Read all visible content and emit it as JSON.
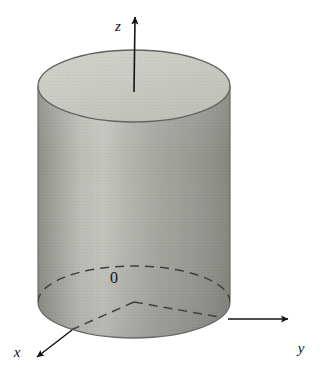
{
  "figure": {
    "kind": "3d-solid-diagram",
    "background_color": "#ffffff",
    "width": 327,
    "height": 384
  },
  "axes": {
    "z": {
      "label": "z",
      "label_x": 118,
      "label_y": 31,
      "arrow_tip_x": 136,
      "arrow_tip_y": 13,
      "origin_x": 134,
      "origin_y": 302,
      "solid_segment": "from top of cylinder up to arrow tip",
      "dashed_segment": "through the interior of the cylinder"
    },
    "y": {
      "label": "y",
      "label_x": 299,
      "label_y": 352,
      "arrow_tip_x": 292,
      "arrow_tip_y": 320,
      "solid_segment": "outside the cylinder silhouette",
      "dashed_segment": "inside the cylinder from origin"
    },
    "x": {
      "label": "x",
      "label_x": 16,
      "label_y": 357,
      "arrow_tip_x": 33,
      "arrow_tip_y": 360,
      "solid_segment": "outside the cylinder silhouette",
      "dashed_segment": "inside the cylinder from origin"
    }
  },
  "origin": {
    "label": "0",
    "label_x": 110,
    "label_y": 282,
    "point_x": 134,
    "point_y": 302
  },
  "cylinder": {
    "center_x": 134,
    "radius_x": 96,
    "radius_y": 36,
    "top_center_y": 86,
    "bottom_center_y": 302,
    "top_face_color": "#c9c9c4",
    "body_light_color": "#c2c2bd",
    "body_mid_color": "#a8a8a3",
    "body_dark_color": "#8e8e89",
    "outline_color": "#5a5a57"
  },
  "colors": {
    "ink": "#141414",
    "dashed_ink": "#3d3d3b",
    "paper": "#ffffff"
  }
}
